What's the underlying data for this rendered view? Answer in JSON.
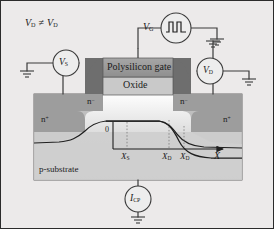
{
  "figure": {
    "background_color": "#eceaea",
    "border_color": "#2b2b2b"
  },
  "annotations": {
    "bias_condition": {
      "v": "V",
      "sub1": "D",
      "relation": "≠",
      "v2": "V",
      "sub2": "D"
    },
    "gate_source": {
      "v": "V",
      "sub": "G"
    },
    "source_meter": {
      "v": "V",
      "sub": "S"
    },
    "drain_meter": {
      "v": "V",
      "sub": "D"
    },
    "current_meter": {
      "i": "I",
      "sub": "CP"
    }
  },
  "device": {
    "gate_label": "Polysilicon gate",
    "oxide_label": "Oxide",
    "substrate_label": "p-substrate",
    "regions": [
      {
        "name": "n-minus-left",
        "text": "n",
        "charge": "−"
      },
      {
        "name": "n-minus-right",
        "text": "n",
        "charge": "−"
      },
      {
        "name": "n-plus-left",
        "text": "n",
        "charge": "+"
      },
      {
        "name": "n-plus-right",
        "text": "n",
        "charge": "+"
      }
    ],
    "colors": {
      "substrate": "#b9b9b9",
      "diffusion": "#9d9d9d",
      "gate": "#9a9a9a",
      "oxide": "#c9c9c9",
      "spacer": "#6e6e6e",
      "channel": "#f2f2f2",
      "wire": "#3a3a3a"
    }
  },
  "axis": {
    "origin_label": "0",
    "axis_label": "X",
    "ticks": [
      {
        "label": "X",
        "sub": "S"
      },
      {
        "label": "X",
        "sub": "D"
      },
      {
        "label": "X",
        "sub": "D"
      }
    ]
  }
}
